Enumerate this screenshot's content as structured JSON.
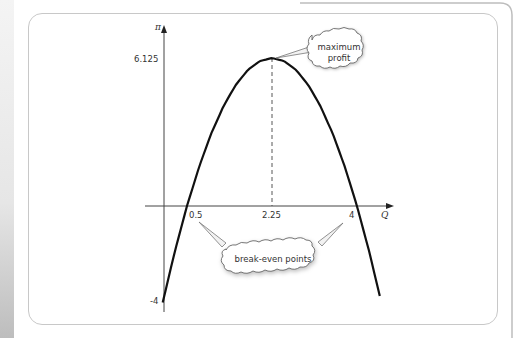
{
  "chart_data": {
    "type": "line",
    "title": "",
    "xlabel": "Q",
    "ylabel": "π",
    "function": "π = -2Q² + 9Q - 4",
    "x": [
      0,
      0.25,
      0.5,
      0.75,
      1,
      1.25,
      1.5,
      1.75,
      2,
      2.25,
      2.5,
      2.75,
      3,
      3.25,
      3.5,
      3.75,
      4,
      4.25,
      4.47
    ],
    "series": [
      {
        "name": "profit",
        "values": [
          -4,
          -1.875,
          0,
          1.625,
          3,
          4.125,
          5,
          5.625,
          6,
          6.125,
          6,
          5.625,
          5,
          4.125,
          3,
          1.625,
          0,
          -1.875,
          -3.73
        ]
      }
    ],
    "x_ticks": [
      "0.5",
      "2.25",
      "4"
    ],
    "y_ticks": [
      "6.125",
      "-4"
    ],
    "annotations": [
      {
        "text": "maximum profit",
        "target": [
          2.25,
          6.125
        ]
      },
      {
        "text": "break-even points",
        "targets": [
          [
            0.5,
            0
          ],
          [
            4,
            0
          ]
        ]
      }
    ],
    "vertical_dashed_line": {
      "x": 2.25,
      "from": 0,
      "to": 6.125
    },
    "grid": false,
    "legend": null
  },
  "labels": {
    "y_axis": "π",
    "x_axis": "Q",
    "y_max": "6.125",
    "y_min": "-4",
    "x_break1": "0.5",
    "x_peak": "2.25",
    "x_break2": "4",
    "cloud_max_line1": "maximum",
    "cloud_max_line2": "profit",
    "cloud_break": "break-even points"
  }
}
